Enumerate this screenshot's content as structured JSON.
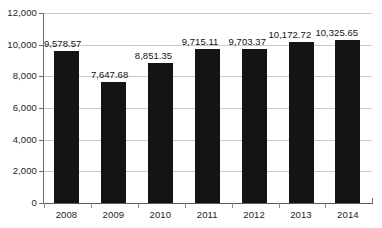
{
  "chart_data": {
    "type": "bar",
    "title": "",
    "xlabel": "",
    "ylabel": "",
    "categories": [
      "2008",
      "2009",
      "2010",
      "2011",
      "2012",
      "2013",
      "2014"
    ],
    "values": [
      9578.57,
      7647.68,
      8851.35,
      9715.11,
      9703.37,
      10172.72,
      10325.65
    ],
    "value_labels": [
      "9,578.57",
      "7,647.68",
      "8,851.35",
      "9,715.11",
      "9,703.37",
      "10,172.72",
      "10,325.65"
    ],
    "ylim": [
      0,
      12000
    ],
    "ytick_values": [
      0,
      2000,
      4000,
      6000,
      8000,
      10000,
      12000
    ],
    "ytick_labels": [
      "0",
      "2,000",
      "4,000",
      "6,000",
      "8,000",
      "10,000",
      "12,000"
    ],
    "grid": true,
    "legend": null,
    "series": [
      {
        "name": "",
        "values": [
          9578.57,
          7647.68,
          8851.35,
          9715.11,
          9703.37,
          10172.72,
          10325.65
        ]
      }
    ],
    "colors": {
      "bar": "#141414",
      "gridline": "#c9c9c9",
      "axis": "#6b6b6b",
      "text": "#1d1d1d",
      "background": "#ffffff"
    }
  }
}
